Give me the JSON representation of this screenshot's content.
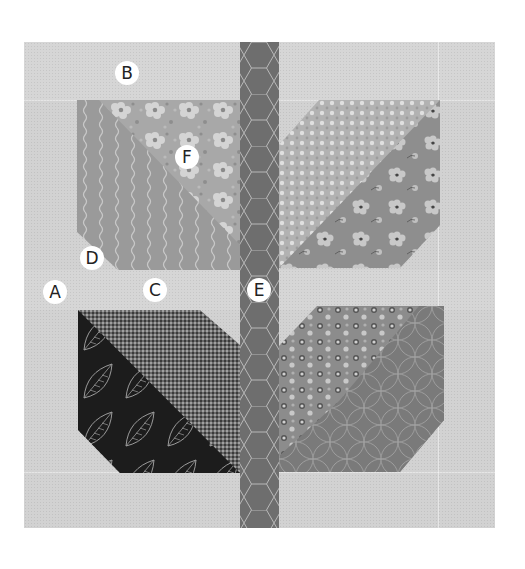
{
  "figure": {
    "title": "",
    "colors": {
      "background_fabric": "#d2d2d2",
      "stem": "#6e6e6e",
      "leaf_tl_stripe": "#9a9a9a",
      "leaf_tl_floral": "#aaaaaa",
      "leaf_tr_dots": "#b4b4b4",
      "leaf_tr_floral": "#8e8e8e",
      "leaf_bl_leafprint": "#1e1e1e",
      "leaf_bl_gingham": "#4a4a4a",
      "leaf_br_dots": "#8c8c8c",
      "leaf_br_circles": "#7a7a7a",
      "label_bg": "#ffffff"
    }
  },
  "labels": [
    {
      "id": "A",
      "text": "A",
      "x": 55,
      "y": 292
    },
    {
      "id": "B",
      "text": "B",
      "x": 127,
      "y": 73
    },
    {
      "id": "C",
      "text": "C",
      "x": 155,
      "y": 290
    },
    {
      "id": "D",
      "text": "D",
      "x": 92,
      "y": 258
    },
    {
      "id": "E",
      "text": "E",
      "x": 259,
      "y": 290
    },
    {
      "id": "F",
      "text": "F",
      "x": 187,
      "y": 157
    }
  ]
}
